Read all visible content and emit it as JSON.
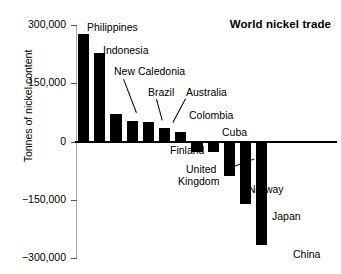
{
  "chart_data": {
    "type": "bar",
    "title": "World nickel trade",
    "xlabel": "",
    "ylabel": "Tonnes of nickel content",
    "ylim": [
      -300000,
      300000
    ],
    "yticks": [
      300000,
      150000,
      0,
      -150000,
      -300000
    ],
    "ytick_labels": [
      "300,000",
      "150,000",
      "0",
      "−150,000",
      "−300,000"
    ],
    "grid": false,
    "legend": "none",
    "bar_color": "#000000",
    "categories": [
      "Philippines",
      "Indonesia",
      "New Caledonia",
      "Brazil",
      "Australia",
      "Colombia",
      "Cuba",
      "Finland",
      "United Kingdom",
      "Norway",
      "Japan",
      "China"
    ],
    "values": [
      278000,
      228000,
      70000,
      52000,
      50000,
      36000,
      25000,
      -26000,
      -28000,
      -90000,
      -160000,
      -267000
    ],
    "annotations": [
      {
        "text": "Philippines",
        "target": "Philippines",
        "leader": false
      },
      {
        "text": "Indonesia",
        "target": "Indonesia",
        "leader": false
      },
      {
        "text": "New Caledonia",
        "target": "New Caledonia",
        "leader": true
      },
      {
        "text": "Brazil",
        "target": "Brazil",
        "leader": true
      },
      {
        "text": "Australia",
        "target": "Australia",
        "leader": true
      },
      {
        "text": "Colombia",
        "target": "Colombia",
        "leader": false
      },
      {
        "text": "Cuba",
        "target": "Cuba",
        "leader": false
      },
      {
        "text": "Finland",
        "target": "Finland",
        "leader": false
      },
      {
        "text": "United Kingdom",
        "target": "United Kingdom",
        "leader": true
      },
      {
        "text": "Norway",
        "target": "Norway",
        "leader": false
      },
      {
        "text": "Japan",
        "target": "Japan",
        "leader": false
      },
      {
        "text": "China",
        "target": "China",
        "leader": false
      }
    ]
  },
  "labels": {
    "philippines": "Philippines",
    "indonesia": "Indonesia",
    "new_caledonia": "New Caledonia",
    "brazil": "Brazil",
    "australia": "Australia",
    "colombia": "Colombia",
    "cuba": "Cuba",
    "finland": "Finland",
    "united": "United",
    "kingdom": "Kingdom",
    "norway": "Norway",
    "japan": "Japan",
    "china": "China"
  }
}
